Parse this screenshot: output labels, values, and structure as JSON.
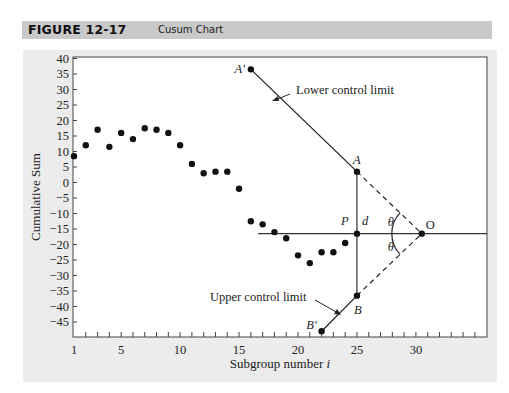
{
  "figure": {
    "number": "FIGURE 12-17",
    "title": "Cusum Chart"
  },
  "chart_data": {
    "type": "scatter",
    "title": "Cusum Chart",
    "xlabel": "Subgroup number i",
    "xlabel_main": "Subgroup number",
    "xlabel_var": "i",
    "ylabel": "Cumulative Sum",
    "xlim": [
      1,
      35
    ],
    "ylim": [
      -48,
      40
    ],
    "x_ticks": [
      1,
      5,
      10,
      15,
      20,
      25,
      30
    ],
    "y_ticks": [
      40,
      35,
      30,
      25,
      20,
      15,
      10,
      5,
      0,
      -5,
      -10,
      -15,
      -20,
      -25,
      -30,
      -35,
      -40,
      -45
    ],
    "grid": false,
    "series": [
      {
        "name": "Cumulative sum",
        "x": [
          1,
          2,
          3,
          4,
          5,
          6,
          7,
          8,
          9,
          10,
          11,
          12,
          13,
          14,
          15,
          16,
          17,
          18,
          19,
          20,
          21,
          22,
          23,
          24,
          25
        ],
        "y": [
          8.5,
          12,
          17,
          11.5,
          16,
          14,
          17.5,
          17,
          16,
          12,
          6,
          3,
          3.5,
          3.5,
          -2,
          -12.5,
          -13.5,
          -16,
          -18,
          -23.5,
          -26,
          -22.5,
          -22.5,
          -19.5,
          -16.5
        ]
      }
    ],
    "annotations": {
      "horizontal_line": {
        "y": -16.5,
        "x_from": 16.5,
        "x_to": 35
      },
      "points": {
        "A_prime": {
          "label": "A'",
          "x": 16,
          "y": 36.5
        },
        "A": {
          "label": "A",
          "x": 25,
          "y": 3.5
        },
        "P": {
          "label": "P",
          "x": 25,
          "y": -16.5
        },
        "O": {
          "label": "O",
          "x": 30.5,
          "y": -16.5
        },
        "B": {
          "label": "B",
          "x": 25,
          "y": -36.5
        },
        "B_prime": {
          "label": "B'",
          "x": 22,
          "y": -48
        }
      },
      "d_label": "d",
      "theta_label": "θ",
      "lower_control_limit": "Lower control limit",
      "upper_control_limit": "Upper control limit"
    }
  }
}
